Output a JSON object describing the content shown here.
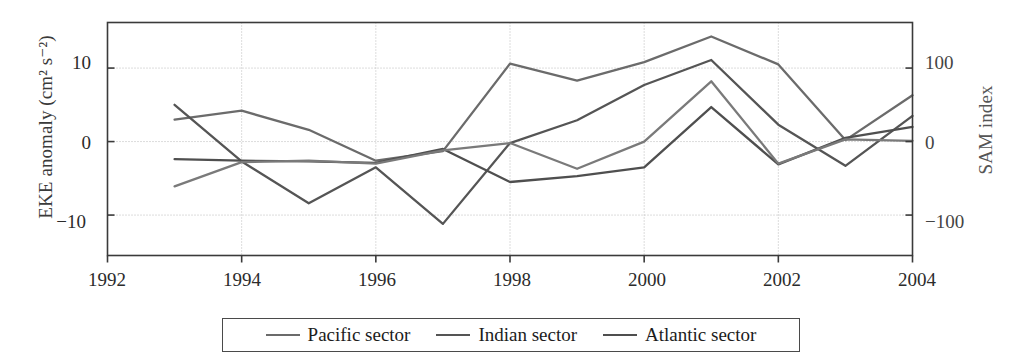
{
  "chart_data": {
    "type": "line",
    "title": "",
    "xlabel": "",
    "ylabel": "EKE anomaly (cm² s⁻²)",
    "y2label": "SAM index",
    "xlim": [
      1992,
      2004
    ],
    "ylim": [
      -15.5,
      16.2
    ],
    "y2lim": [
      -155,
      162
    ],
    "grid": true,
    "grid_axes": "both",
    "legend_position": "bottom-center",
    "xticks": [
      1992,
      1994,
      1996,
      1998,
      2000,
      2002,
      2004
    ],
    "xticklabels": [
      "1992",
      "1994",
      "1996",
      "1998",
      "2000",
      "2002",
      "2004"
    ],
    "yticks": [
      -10,
      0,
      10
    ],
    "yticklabels": [
      "−10",
      "0",
      "10"
    ],
    "y2ticks": [
      -100,
      0,
      100
    ],
    "y2ticklabels": [
      "−100",
      "0",
      "100"
    ],
    "x": [
      1993,
      1994,
      1995,
      1996,
      1997,
      1998,
      1999,
      2000,
      2001,
      2002,
      2003,
      2004
    ],
    "series": [
      {
        "name": "Pacific sector",
        "axis": "left",
        "color": "#6b6b6b",
        "values": [
          3.0,
          4.2,
          1.6,
          -2.6,
          -1.3,
          10.6,
          8.3,
          10.8,
          14.3,
          10.5,
          0.2,
          6.3
        ]
      },
      {
        "name": "Indian sector",
        "axis": "left",
        "color": "#555555",
        "values": [
          5.0,
          -2.7,
          -8.4,
          -3.5,
          -11.2,
          -0.2,
          2.9,
          7.7,
          11.1,
          2.3,
          -3.3,
          3.5
        ]
      },
      {
        "name": "Atlantic sector",
        "axis": "left",
        "color": "#4f4f4f",
        "values": [
          -2.4,
          -2.6,
          -2.7,
          -2.9,
          -1.0,
          -5.5,
          -4.7,
          -3.5,
          4.7,
          -3.1,
          0.5,
          2.0
        ]
      },
      {
        "name": "SAM index",
        "axis": "right",
        "color": "#7a7a7a",
        "values": [
          -61,
          -28,
          -26,
          -30,
          -12,
          -2,
          -37,
          0,
          82,
          -30,
          3,
          1
        ]
      }
    ]
  },
  "legend": {
    "entries": [
      {
        "label": "Pacific sector",
        "color": "#6b6b6b"
      },
      {
        "label": "Indian sector",
        "color": "#555555"
      },
      {
        "label": "Atlantic sector",
        "color": "#4f4f4f"
      }
    ]
  },
  "axes": {
    "left_title": "EKE anomaly (cm² s⁻²)",
    "right_title": "SAM index",
    "x_ticks": [
      "1992",
      "1994",
      "1996",
      "1998",
      "2000",
      "2002",
      "2004"
    ],
    "y_left_ticks": [
      "10",
      "0",
      "−10"
    ],
    "y_right_ticks": [
      "100",
      "0",
      "−100"
    ]
  },
  "colors": {
    "frame": "#3a3a3a",
    "grid": "#b9b9b9",
    "background": "#ffffff"
  }
}
